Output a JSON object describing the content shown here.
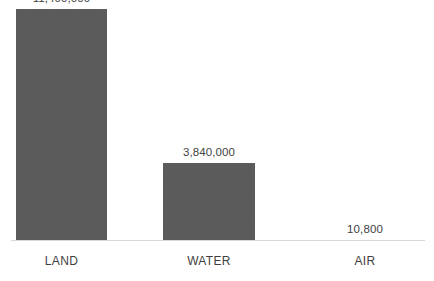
{
  "chart_data": {
    "type": "bar",
    "title": "",
    "subtitle": "",
    "xlabel": "",
    "ylabel": "",
    "categories": [
      "LAND",
      "WATER",
      "AIR"
    ],
    "values": [
      11400000,
      3840000,
      10800
    ],
    "value_labels": [
      "11,400,000",
      "3,840,000",
      "10,800"
    ],
    "series": [
      {
        "name": "",
        "values": [
          11400000,
          3840000,
          10800
        ]
      }
    ],
    "ylim": [
      0,
      11800000
    ],
    "grid": false,
    "legend": false,
    "legend_position": "none",
    "data_labels_shown": true,
    "axis_line_shown": true,
    "y_axis_ticks_shown": false,
    "bar_color": "#595959",
    "label_color": "#3f3f3f",
    "axis_line_color": "#d9d9d9",
    "background_color": "#ffffff"
  },
  "layout": {
    "bars": [
      {
        "left": 16,
        "width": 91,
        "height": 220
      },
      {
        "left": 163,
        "width": 92,
        "height": 71
      },
      {
        "left": 320,
        "width": 90,
        "height": 6
      }
    ],
    "value_label_tops": [
      5,
      154,
      219
    ],
    "value_label_centers": [
      61.5,
      209,
      365
    ]
  }
}
